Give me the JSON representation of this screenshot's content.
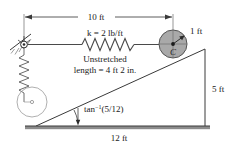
{
  "figure": {
    "colors": {
      "line": "#4a4a4a",
      "dark_line": "#2b2b2b",
      "disk_fill": "#a9a9a9",
      "disk_stroke": "#555555",
      "ground_fill": "#8c8c8c",
      "text": "#1a1a1a",
      "light_line": "#9a9a9a"
    },
    "labels": {
      "top_dimension": "10 ft",
      "spring_constant": "k = 2 lb/ft",
      "unstretched_line1": "Unstretched",
      "unstretched_line2": "length = 4 ft 2 in.",
      "radius": "1 ft",
      "disk_center": "C",
      "angle_prefix": "tan",
      "angle_exponent": "−1",
      "angle_value": "(5/12)",
      "right_dimension": "5 ft",
      "bottom_dimension": "12 ft"
    }
  }
}
